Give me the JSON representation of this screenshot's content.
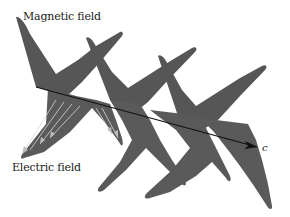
{
  "diagram": {
    "labels": {
      "magnetic": "Magnetic field",
      "electric": "Electric field",
      "propagation": "c"
    },
    "colors": {
      "field_fill": "#565656",
      "electric_fill": "#5e5e5e",
      "vector_lines": "#d8d8d8",
      "axis": "#111111",
      "background": "#ffffff"
    },
    "elements": {
      "magnetic_wave": "zigzag sheet of dark gray lobes above/below axis",
      "electric_wave": "lobes with vector arrows, near left",
      "propagation_axis": "arrow pointing right-down labeled c"
    }
  }
}
